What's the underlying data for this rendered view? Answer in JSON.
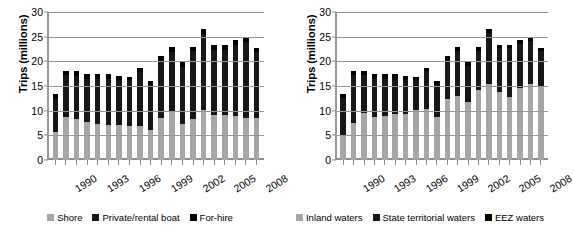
{
  "chart_data": [
    {
      "type": "bar",
      "stacked": true,
      "title": "",
      "xlabel": "",
      "ylabel": "Trips (millions)",
      "ylim": [
        0,
        30
      ],
      "yticks": [
        0,
        5,
        10,
        15,
        20,
        25,
        30
      ],
      "grid": true,
      "legend_position": "bottom",
      "categories": [
        "1990",
        "1991",
        "1992",
        "1993",
        "1994",
        "1995",
        "1996",
        "1997",
        "1998",
        "1999",
        "2000",
        "2001",
        "2002",
        "2003",
        "2004",
        "2005",
        "2006",
        "2007",
        "2008",
        "2009"
      ],
      "tick_labels": [
        "1990",
        "1993",
        "1996",
        "1999",
        "2002",
        "2005",
        "2008"
      ],
      "series": [
        {
          "name": "Shore",
          "color": "#a6a6a6",
          "values": [
            5.7,
            8.8,
            8.4,
            7.7,
            7.4,
            7.0,
            7.0,
            6.8,
            6.8,
            6.0,
            8.5,
            9.9,
            7.3,
            8.4,
            10.1,
            9.2,
            9.2,
            9.0,
            8.6,
            8.6
          ]
        },
        {
          "name": "Private/rental boat",
          "color": "#171717",
          "values": [
            6.6,
            8.4,
            8.6,
            8.8,
            9.2,
            9.4,
            9.2,
            9.4,
            11.0,
            9.1,
            11.6,
            12.0,
            11.6,
            13.6,
            15.5,
            13.2,
            13.2,
            14.3,
            15.3,
            13.2
          ]
        },
        {
          "name": "For-hire",
          "color": "#000000",
          "values": [
            1.0,
            0.9,
            1.0,
            0.9,
            0.9,
            1.0,
            0.9,
            0.6,
            0.8,
            0.9,
            0.9,
            1.0,
            0.9,
            1.0,
            1.0,
            1.0,
            1.0,
            1.1,
            1.0,
            1.0
          ]
        }
      ]
    },
    {
      "type": "bar",
      "stacked": true,
      "title": "",
      "xlabel": "",
      "ylabel": "Trips (millions)",
      "ylim": [
        0,
        30
      ],
      "yticks": [
        0,
        5,
        10,
        15,
        20,
        25,
        30
      ],
      "grid": true,
      "legend_position": "bottom",
      "categories": [
        "1990",
        "1991",
        "1992",
        "1993",
        "1994",
        "1995",
        "1996",
        "1997",
        "1998",
        "1999",
        "2000",
        "2001",
        "2002",
        "2003",
        "2004",
        "2005",
        "2006",
        "2007",
        "2008",
        "2009"
      ],
      "tick_labels": [
        "1990",
        "1993",
        "1996",
        "1999",
        "2002",
        "2005",
        "2008"
      ],
      "series": [
        {
          "name": "Inland waters",
          "color": "#a6a6a6",
          "values": [
            4.9,
            7.5,
            9.6,
            8.7,
            9.0,
            9.4,
            9.4,
            10.2,
            10.4,
            8.8,
            12.3,
            12.9,
            11.7,
            14.2,
            15.4,
            13.7,
            12.8,
            14.6,
            15.5,
            14.8
          ]
        },
        {
          "name": "State territorial waters",
          "color": "#171717",
          "values": [
            7.6,
            9.7,
            7.6,
            7.9,
            7.7,
            7.1,
            6.9,
            6.2,
            7.6,
            6.5,
            7.9,
            9.2,
            7.4,
            8.0,
            10.4,
            9.0,
            10.0,
            9.0,
            8.6,
            7.2
          ]
        },
        {
          "name": "EEZ waters",
          "color": "#000000",
          "values": [
            0.8,
            0.9,
            0.8,
            0.8,
            0.8,
            0.9,
            0.8,
            0.4,
            0.6,
            0.7,
            0.8,
            0.8,
            0.7,
            0.8,
            0.8,
            0.7,
            0.6,
            0.8,
            0.8,
            0.7
          ]
        }
      ]
    }
  ],
  "charts": [
    {
      "id": "left",
      "y_axis_title": "Trips (millions)",
      "y_ticks": [
        "30",
        "25",
        "20",
        "15",
        "10",
        "5",
        "0"
      ],
      "x_tick_labels": [
        "1990",
        "1993",
        "1996",
        "1999",
        "2002",
        "2005",
        "2008"
      ],
      "legend": [
        {
          "label": "Shore",
          "swatch": "s0"
        },
        {
          "label": "Private/rental boat",
          "swatch": "s1"
        },
        {
          "label": "For-hire",
          "swatch": "s2"
        }
      ]
    },
    {
      "id": "right",
      "y_axis_title": "Trips (millions)",
      "y_ticks": [
        "30",
        "25",
        "20",
        "15",
        "10",
        "5",
        "0"
      ],
      "x_tick_labels": [
        "1990",
        "1993",
        "1996",
        "1999",
        "2002",
        "2005",
        "2008"
      ],
      "legend": [
        {
          "label": "Inland waters",
          "swatch": "s0"
        },
        {
          "label": "State territorial waters",
          "swatch": "s1"
        },
        {
          "label": "EEZ waters",
          "swatch": "s2"
        }
      ]
    }
  ]
}
